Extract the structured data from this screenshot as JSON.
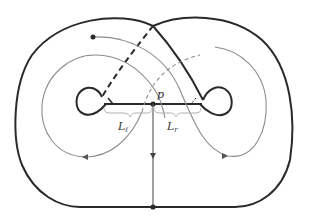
{
  "figure": {
    "labels": {
      "point": "p",
      "left_segment": "L",
      "left_segment_sub": "ℓ",
      "right_segment": "L",
      "right_segment_sub": "r"
    },
    "colors": {
      "thick_stroke": "#2a2a2a",
      "thin_stroke": "#8c8c8c",
      "background": "#ffffff"
    }
  }
}
